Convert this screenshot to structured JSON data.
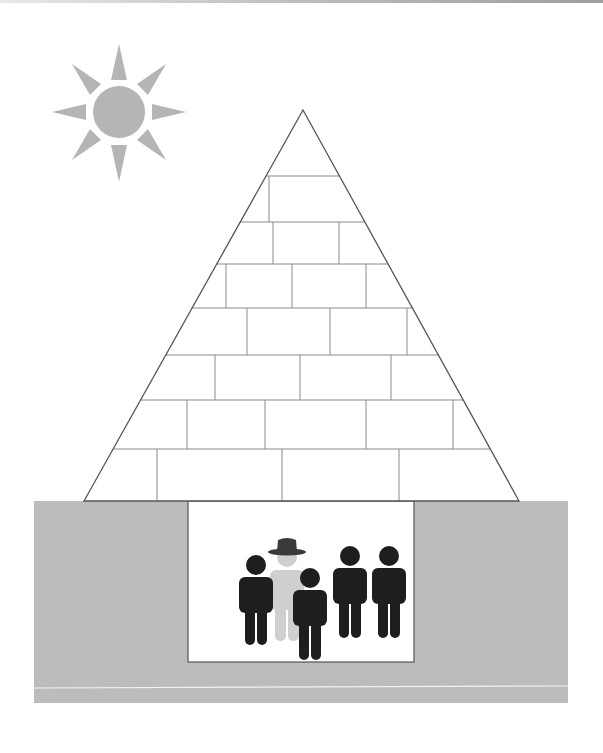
{
  "diagram": {
    "colors": {
      "background": "#ffffff",
      "ground": "#bcbcbc",
      "sun": "#b5b5b5",
      "brick_line": "#8a8a8a",
      "pyramid_outline": "#555555",
      "people": "#1e1e1e",
      "highlighted_person": "#cfcfcf",
      "hat": "#3a3a3a"
    },
    "sun": {
      "cx": 119,
      "cy": 112,
      "r": 26,
      "rays": 8
    },
    "pyramid": {
      "apex": [
        303,
        110
      ],
      "base_left": [
        84,
        501
      ],
      "base_right": [
        519,
        501
      ],
      "brick_rows": 7
    },
    "chamber": {
      "x": 188,
      "y": 501,
      "width": 226,
      "height": 161
    },
    "people": [
      {
        "x": 256,
        "y": 565,
        "highlighted": false
      },
      {
        "x": 287,
        "y": 548,
        "highlighted": true,
        "hat": true
      },
      {
        "x": 310,
        "y": 578,
        "highlighted": false
      },
      {
        "x": 350,
        "y": 556,
        "highlighted": false
      },
      {
        "x": 389,
        "y": 556,
        "highlighted": false
      }
    ]
  }
}
